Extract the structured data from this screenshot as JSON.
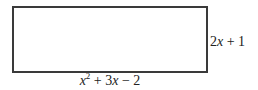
{
  "diagram": {
    "shape": "rectangle",
    "height_label": {
      "coef": "2",
      "var": "x",
      "rest": " + 1",
      "full": "2x + 1"
    },
    "width_label": {
      "var": "x",
      "exp": "2",
      "rest1": " + 3",
      "var2": "x",
      "rest2": " − 2",
      "full": "x² + 3x − 2"
    },
    "colors": {
      "border": "#3a3a3a",
      "text": "#222222",
      "background": "#ffffff"
    }
  }
}
